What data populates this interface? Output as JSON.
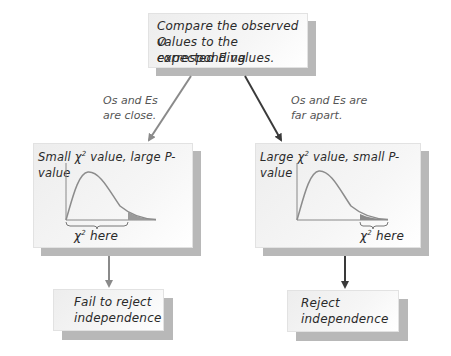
{
  "top_box": {
    "lines": [
      "Compare the observed O",
      "values to the corresponding",
      "expected E values."
    ]
  },
  "branches": {
    "left": {
      "condition_lines": [
        "Os and Es",
        "are close."
      ],
      "heading_prefix": "Small χ",
      "heading_sup": "2",
      "heading_suffix": " value, large P-value",
      "chart_label_prefix": "χ",
      "chart_label_sup": "2",
      "chart_label_suffix": " here",
      "arrow_color": "#8a8a8a",
      "result_lines": [
        "Fail to reject",
        "independence"
      ]
    },
    "right": {
      "condition_lines": [
        "Os and Es are",
        "far apart."
      ],
      "heading_prefix": "Large χ",
      "heading_sup": "2",
      "heading_suffix": " value, small P-value",
      "chart_label_prefix": "χ",
      "chart_label_sup": "2",
      "chart_label_suffix": " here",
      "arrow_color": "#3a3a3a",
      "result_lines": [
        "Reject",
        "independence"
      ]
    }
  },
  "colors": {
    "curve": "#8c8c8c",
    "tail_shading": "#9a9a9a",
    "box_shadow": "#b8b8b8"
  }
}
